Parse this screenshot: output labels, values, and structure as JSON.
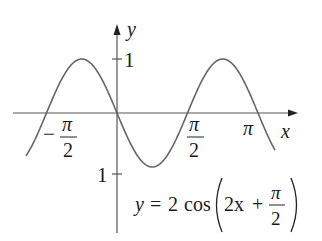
{
  "chart_data": {
    "type": "line",
    "title": "",
    "equation": "y = 2 cos(2x + π/2)",
    "equation_parts": {
      "lhs": "y",
      "eq": "=",
      "coef": "2",
      "fn": "cos",
      "arg_a": "2x",
      "plus": "+",
      "frac_num": "π",
      "frac_den": "2"
    },
    "xlabel": "x",
    "ylabel": "y",
    "x_ticks": [
      {
        "value": -1.5708,
        "label": "−π/2",
        "num": "π",
        "den": "2",
        "sign": "−"
      },
      {
        "value": 1.5708,
        "label": "π/2",
        "num": "π",
        "den": "2"
      },
      {
        "value": 3.1416,
        "label": "π"
      }
    ],
    "y_ticks": [
      {
        "value": 1,
        "label": "1"
      },
      {
        "value": -1,
        "label": "1"
      }
    ],
    "xlim": [
      -2.3,
      3.75
    ],
    "ylim": [
      -2.3,
      2.0
    ],
    "grid": false,
    "legend": "none",
    "series": [
      {
        "name": "y = 2 cos(2x + π/2)",
        "x": [
          -2.0,
          -1.5708,
          -0.7854,
          0,
          0.7854,
          1.5708,
          2.3562,
          3.1416,
          3.5
        ],
        "values": [
          1.82,
          0,
          2,
          0,
          -2,
          0,
          2,
          0,
          -1.31
        ]
      }
    ],
    "color": "#555555"
  }
}
